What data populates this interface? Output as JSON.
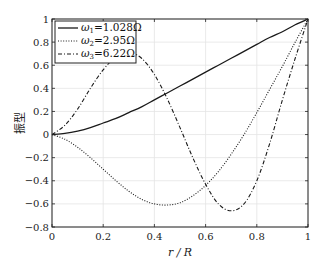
{
  "chart_data": {
    "type": "line",
    "title": "",
    "xlabel": "r / R",
    "ylabel": "振型",
    "xlim": [
      0,
      1
    ],
    "ylim": [
      -0.8,
      1
    ],
    "grid": true,
    "legend_position": "upper-left",
    "x_ticks": [
      "0",
      "0.2",
      "0.4",
      "0.6",
      "0.8",
      "1"
    ],
    "y_ticks": [
      "-0.8",
      "-0.6",
      "-0.4",
      "-0.2",
      "0",
      "0.2",
      "0.4",
      "0.6",
      "0.8",
      "1"
    ],
    "x": [
      0,
      0.05,
      0.1,
      0.15,
      0.2,
      0.25,
      0.3,
      0.35,
      0.4,
      0.45,
      0.5,
      0.55,
      0.6,
      0.65,
      0.7,
      0.75,
      0.8,
      0.85,
      0.9,
      0.95,
      1.0
    ],
    "series": [
      {
        "name": "ω1=1.028Ω",
        "legend_main": "ω",
        "legend_sub": "1",
        "legend_value": "=1.028Ω",
        "style": "solid",
        "values": [
          0,
          0.01,
          0.03,
          0.06,
          0.1,
          0.14,
          0.19,
          0.24,
          0.3,
          0.36,
          0.42,
          0.48,
          0.54,
          0.6,
          0.66,
          0.72,
          0.78,
          0.84,
          0.89,
          0.95,
          1.0
        ]
      },
      {
        "name": "ω2=2.95Ω",
        "legend_main": "ω",
        "legend_sub": "2",
        "legend_value": "=2.95Ω",
        "style": "dotted",
        "values": [
          0,
          -0.04,
          -0.11,
          -0.2,
          -0.3,
          -0.4,
          -0.49,
          -0.56,
          -0.6,
          -0.61,
          -0.59,
          -0.53,
          -0.44,
          -0.32,
          -0.17,
          0.0,
          0.19,
          0.39,
          0.59,
          0.8,
          1.0
        ]
      },
      {
        "name": "ω3=6.22Ω",
        "legend_main": "ω",
        "legend_sub": "3",
        "legend_value": "=6.22Ω",
        "style": "dashdot",
        "values": [
          0,
          0.08,
          0.22,
          0.4,
          0.56,
          0.67,
          0.71,
          0.66,
          0.52,
          0.31,
          0.06,
          -0.2,
          -0.43,
          -0.6,
          -0.66,
          -0.6,
          -0.4,
          -0.08,
          0.3,
          0.66,
          1.0
        ]
      }
    ]
  }
}
